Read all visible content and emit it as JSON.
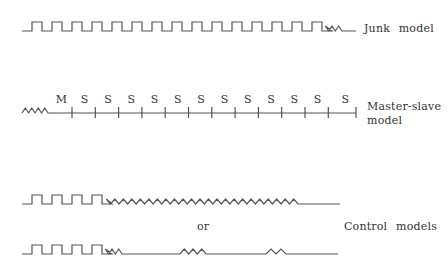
{
  "diagram": {
    "stroke_color": "#555555",
    "rows": [
      {
        "id": "junk",
        "label": "Junk model",
        "baseline_y": 31,
        "pulse_height": 9,
        "start_x": 22,
        "pulse_start_x": 32,
        "pulse_period": 20,
        "pulse_count": 15,
        "segments_after": [
          {
            "type": "zigzag",
            "length": 20,
            "teeth": 3
          },
          {
            "type": "line",
            "length": 14
          }
        ]
      },
      {
        "id": "control-a",
        "baseline_y": 204,
        "pulse_height": 9,
        "start_x": 22,
        "pulse_start_x": 32,
        "pulse_period": 20,
        "pulse_count": 4,
        "segments_after": [
          {
            "type": "zigzag",
            "length": 196,
            "teeth": 23
          },
          {
            "type": "line",
            "length": 42
          }
        ]
      },
      {
        "id": "control-b",
        "baseline_y": 254,
        "pulse_height": 9,
        "start_x": 22,
        "pulse_start_x": 32,
        "pulse_period": 20,
        "pulse_count": 4,
        "segments_after": [
          {
            "type": "zigzag",
            "length": 20,
            "teeth": 3
          },
          {
            "type": "line",
            "length": 58
          },
          {
            "type": "zigzag",
            "length": 26,
            "teeth": 3
          },
          {
            "type": "line",
            "length": 60
          },
          {
            "type": "zigzag",
            "length": 20,
            "teeth": 2
          },
          {
            "type": "line",
            "length": 52
          }
        ]
      }
    ],
    "master_slave": {
      "label_line1": "Master-slave",
      "label_line2": "model",
      "baseline_y": 113,
      "zigzag_start_x": 22,
      "zigzag_end_x": 48,
      "zigzag_teeth": 4,
      "line_end_x": 356,
      "tick_start_x": 72,
      "tick_spacing": 23.3,
      "tick_count": 13,
      "labels": [
        "M",
        "S",
        "S",
        "S",
        "S",
        "S",
        "S",
        "S",
        "S",
        "S",
        "S",
        "S",
        "S"
      ]
    },
    "texts": {
      "junk_label": "Junk model",
      "or_label": "or",
      "control_label": "Control models"
    }
  }
}
